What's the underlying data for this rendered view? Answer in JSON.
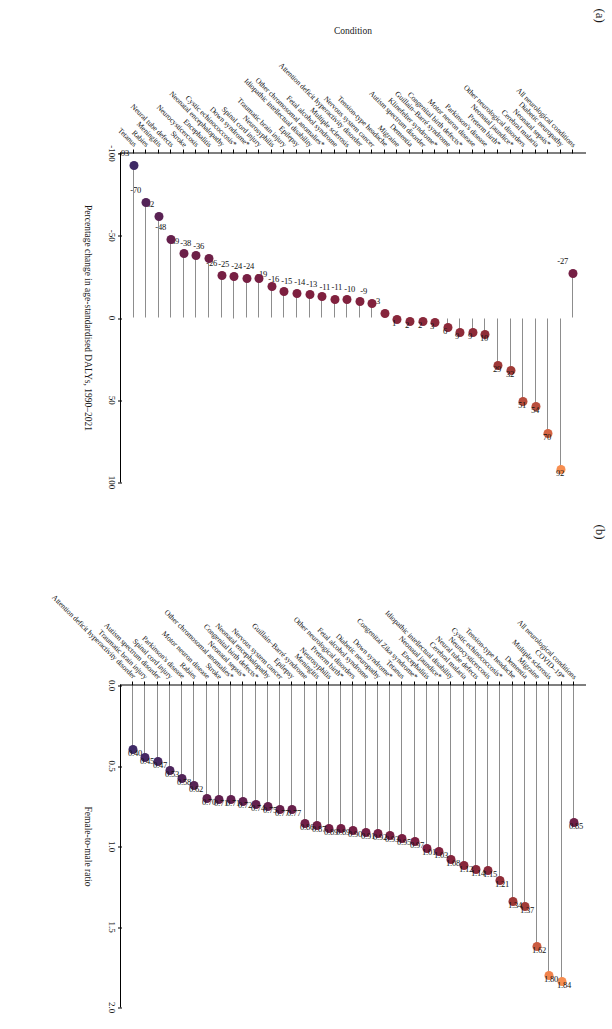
{
  "figure": {
    "panel_a_tag": "(a)",
    "panel_b_tag": "(b)"
  },
  "chart_data": [
    {
      "type": "bar",
      "panel": "(a)",
      "title": "",
      "xlabel": "Percentage change in age-standardised DALYs, 1990–2021",
      "ylabel": "Condition",
      "orientation": "vertical-lollipop",
      "xlim": [
        -100,
        100
      ],
      "xticks": [
        -100,
        -50,
        0,
        50,
        100
      ],
      "ylim": [
        0,
        42
      ],
      "grid": false,
      "zero_reference_line": true,
      "categories": [
        "All neurological conditions",
        "Diabetic neuropathy",
        "Neonatal sepsis*",
        "Cerebral malaria",
        "Other neurological disorders",
        "Neonatal jaundice*",
        "Preterm birth*",
        "Parkinson's disease",
        "Motor neuron disease",
        "Congenital birth defects*",
        "Guillain–Barré syndrome",
        "Klinefelter syndrome*",
        "Autism spectrum disorder",
        "Dementia",
        "Migraine",
        "Tension-type headache",
        "Nervous system cancer",
        "Attention deficit hyperactivity disorder",
        "Multiple sclerosis",
        "Fetal alcohol syndrome",
        "Other chromosomal anomalies*",
        "Idiopathic intellectual disability",
        "Epilepsy",
        "Traumatic brain injury",
        "Neurosyphilis",
        "Spinal cord injury",
        "Down syndrome*",
        "Cystic echinococcosis*",
        "Neonatal encephalopathy",
        "Encephalitis",
        "Neurocysticercosis",
        "Stroke",
        "Neural tube defects",
        "Meningitis",
        "Rabies",
        "Tetanus"
      ],
      "values": [
        -27,
        92,
        70,
        54,
        51,
        32,
        29,
        10,
        9,
        9,
        6,
        3,
        2,
        2,
        1,
        -3,
        -9,
        -10,
        -11,
        -11,
        -13,
        -14,
        -15,
        -16,
        -19,
        -24,
        -24,
        -25,
        -26,
        -36,
        -38,
        -39,
        -48,
        -62,
        -70,
        -93
      ],
      "value_labels": [
        "-27",
        "92",
        "70",
        "54",
        "51",
        "32",
        "29",
        "10",
        "9",
        "9",
        "6",
        "3",
        "2",
        "2",
        "1",
        "-3",
        "-9",
        "-10",
        "-11",
        "-11",
        "-13",
        "-14",
        "-15",
        "-16",
        "-19",
        "-24",
        "-24",
        "-25",
        "-26",
        "-36",
        "-38",
        "-39",
        "-48",
        "-62",
        "-70",
        "-93"
      ]
    },
    {
      "type": "bar",
      "panel": "(b)",
      "title": "",
      "xlabel": "Female-to-male ratio",
      "ylabel": "",
      "orientation": "vertical-lollipop",
      "xlim": [
        0,
        2.0
      ],
      "xticks": [
        0.0,
        0.5,
        1.0,
        1.5,
        2.0
      ],
      "ylim": [
        0,
        42
      ],
      "grid": false,
      "zero_reference_line": false,
      "categories": [
        "All neurological conditions",
        "COVID–19*",
        "Multiple sclerosis",
        "Migraine",
        "Dementia",
        "Tension-type headache",
        "Cystic echinococcosis*",
        "Neurocysticercosis",
        "Neural tube defects",
        "Cerebral malaria",
        "Idiopathic intellectual disability",
        "Neonatal jaundice*",
        "Encephalitis",
        "Congenital Zika syndrome*",
        "Tetanus",
        "Down syndrome*",
        "Diabetic neuropathy",
        "Fetal alcohol syndrome",
        "Other neurological disorders",
        "Preterm birth*",
        "Neurosyphilis",
        "Meningitis",
        "Guillain–Barré syndrome",
        "Epilepsy",
        "Nervous system cancer",
        "Neonatal encephalopathy",
        "Congenital birth defects*",
        "Neonatal sepsis*",
        "Other chromosomal anomalies*",
        "Stroke",
        "Motor neuron disease",
        "Rabies",
        "Parkinson's disease",
        "Spinal cord injury",
        "Autism spectrum disorder",
        "Traumatic brain injury",
        "Attention deficit hyperactivity disorder"
      ],
      "values": [
        0.85,
        1.84,
        1.8,
        1.62,
        1.37,
        1.34,
        1.21,
        1.15,
        1.14,
        1.12,
        1.08,
        1.03,
        1.01,
        0.97,
        0.95,
        0.93,
        0.92,
        0.91,
        0.9,
        0.89,
        0.89,
        0.87,
        0.86,
        0.77,
        0.77,
        0.75,
        0.74,
        0.72,
        0.71,
        0.71,
        0.7,
        0.62,
        0.58,
        0.53,
        0.47,
        0.45,
        0.4
      ],
      "value_labels": [
        "0.85",
        "1.84",
        "1.80",
        "1.62",
        "1.37",
        "1.34",
        "1.21",
        "1.15",
        "1.14",
        "1.12",
        "1.08",
        "1.03",
        "1.01",
        "0.97",
        "0.95",
        "0.93",
        "0.92",
        "0.91",
        "0.90",
        "0.89",
        "0.89",
        "0.87",
        "0.86",
        "0.77",
        "0.77",
        "0.75",
        "0.74",
        "0.72",
        "0.71",
        "0.71",
        "0.70",
        "0.62",
        "0.58",
        "0.53",
        "0.47",
        "0.45",
        "0.40"
      ]
    }
  ],
  "colors": {
    "dot_high": "#f57f4b",
    "dot_mid": "#b04a3c",
    "dot_low": "#7e1f3f",
    "dot_lowest": "#3f2a66",
    "stem": "#8d8d8d",
    "axis": "#000000"
  }
}
